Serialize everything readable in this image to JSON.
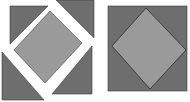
{
  "figure": {
    "colors": {
      "background": "#ffffff",
      "dark_triangle": "#6e6e6e",
      "light_square": "#9a9a9a",
      "outline": "#3a3a3a"
    },
    "panels": [
      {
        "id": "left",
        "label": "exploded",
        "inner_square": [
          [
            52,
            9
          ],
          [
            84,
            41
          ],
          [
            45,
            85
          ],
          [
            13,
            51
          ]
        ],
        "triangles": [
          [
            [
              10,
              6
            ],
            [
              46,
              6
            ],
            [
              10,
              44
            ]
          ],
          [
            [
              56,
              0
            ],
            [
              92,
              0
            ],
            [
              92,
              36
            ]
          ],
          [
            [
              2,
              52
            ],
            [
              2,
              100
            ],
            [
              42,
              100
            ]
          ],
          [
            [
              90,
              46
            ],
            [
              90,
              94
            ],
            [
              50,
              94
            ]
          ]
        ]
      },
      {
        "id": "right",
        "label": "assembled",
        "outer_square": [
          [
            108,
            6
          ],
          [
            187,
            6
          ],
          [
            187,
            91
          ],
          [
            108,
            91
          ]
        ],
        "inner_square": [
          [
            146,
            8
          ],
          [
            186,
            50
          ],
          [
            150,
            88
          ],
          [
            112,
            46
          ]
        ]
      }
    ]
  }
}
